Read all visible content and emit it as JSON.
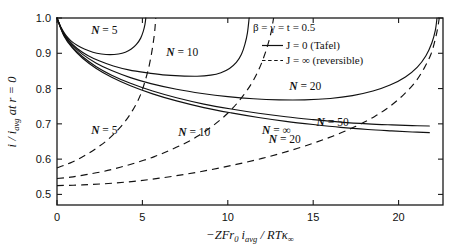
{
  "chart_data": {
    "type": "line",
    "title": "",
    "subtitle": "",
    "xlabel": "-ZFr0 iavg / RT K∞",
    "ylabel": "i / iavg at r = 0",
    "xlim": [
      0,
      22.6
    ],
    "ylim": [
      0.47,
      1.0
    ],
    "grid": false,
    "legend_position": "top-right",
    "xticks": [
      0,
      5,
      10,
      15,
      20
    ],
    "xtick_labels": [
      "0",
      "5",
      "10",
      "15",
      "20"
    ],
    "yticks": [
      0.5,
      0.6,
      0.7,
      0.8,
      0.9,
      1.0
    ],
    "ytick_labels": [
      "0.5",
      "0.6",
      "0.7",
      "0.8",
      "0.9",
      "1.0"
    ],
    "annotations": {
      "params": "β = γ = t = 0.5",
      "legend_solid": "J = 0  (Tafel)",
      "legend_dashed": "J = ∞  (reversible)"
    },
    "series": [
      {
        "name": "N = 5 (Tafel)",
        "label": "N = 5",
        "style": "solid",
        "label_x": 2.0,
        "label_y": 0.955,
        "points": [
          [
            0,
            1.0
          ],
          [
            0.25,
            0.972
          ],
          [
            0.5,
            0.952
          ],
          [
            0.8,
            0.936
          ],
          [
            1.2,
            0.922
          ],
          [
            1.6,
            0.912
          ],
          [
            2.1,
            0.903
          ],
          [
            2.6,
            0.898
          ],
          [
            3.1,
            0.896
          ],
          [
            3.6,
            0.898
          ],
          [
            4.0,
            0.903
          ],
          [
            4.35,
            0.912
          ],
          [
            4.65,
            0.925
          ],
          [
            4.9,
            0.943
          ],
          [
            5.05,
            0.962
          ],
          [
            5.15,
            0.982
          ],
          [
            5.2,
            1.0
          ]
        ]
      },
      {
        "name": "N = 10 (Tafel)",
        "label": "N = 10",
        "style": "solid",
        "label_x": 6.4,
        "label_y": 0.893,
        "points": [
          [
            0,
            1.0
          ],
          [
            0.3,
            0.963
          ],
          [
            0.7,
            0.936
          ],
          [
            1.2,
            0.913
          ],
          [
            1.8,
            0.894
          ],
          [
            2.5,
            0.878
          ],
          [
            3.3,
            0.864
          ],
          [
            4.2,
            0.853
          ],
          [
            5.2,
            0.845
          ],
          [
            6.2,
            0.839
          ],
          [
            7.2,
            0.836
          ],
          [
            8.2,
            0.835
          ],
          [
            9.0,
            0.838
          ],
          [
            9.6,
            0.845
          ],
          [
            10.1,
            0.857
          ],
          [
            10.5,
            0.874
          ],
          [
            10.8,
            0.897
          ],
          [
            11.0,
            0.925
          ],
          [
            11.15,
            0.958
          ],
          [
            11.25,
            1.0
          ]
        ]
      },
      {
        "name": "N = 20 (Tafel)",
        "label": "N = 20",
        "style": "solid",
        "label_x": 13.6,
        "label_y": 0.797,
        "points": [
          [
            0,
            1.0
          ],
          [
            0.4,
            0.955
          ],
          [
            0.9,
            0.923
          ],
          [
            1.5,
            0.897
          ],
          [
            2.3,
            0.872
          ],
          [
            3.2,
            0.851
          ],
          [
            4.3,
            0.831
          ],
          [
            5.5,
            0.814
          ],
          [
            7.0,
            0.798
          ],
          [
            8.5,
            0.786
          ],
          [
            10.0,
            0.777
          ],
          [
            11.5,
            0.771
          ],
          [
            13.0,
            0.768
          ],
          [
            14.5,
            0.768
          ],
          [
            16.0,
            0.772
          ],
          [
            17.3,
            0.78
          ],
          [
            18.5,
            0.793
          ],
          [
            19.5,
            0.81
          ],
          [
            20.4,
            0.833
          ],
          [
            21.1,
            0.861
          ],
          [
            21.6,
            0.893
          ],
          [
            21.95,
            0.93
          ],
          [
            22.15,
            0.965
          ],
          [
            22.25,
            1.0
          ]
        ]
      },
      {
        "name": "N = 50 (Tafel)",
        "label": "N = 50",
        "style": "solid",
        "label_x": 15.2,
        "label_y": 0.695,
        "points": [
          [
            0,
            1.0
          ],
          [
            0.4,
            0.952
          ],
          [
            0.9,
            0.918
          ],
          [
            1.5,
            0.89
          ],
          [
            2.3,
            0.862
          ],
          [
            3.2,
            0.838
          ],
          [
            4.3,
            0.815
          ],
          [
            5.6,
            0.793
          ],
          [
            7.0,
            0.774
          ],
          [
            8.6,
            0.756
          ],
          [
            10.2,
            0.742
          ],
          [
            11.8,
            0.73
          ],
          [
            13.4,
            0.72
          ],
          [
            15.0,
            0.712
          ],
          [
            16.6,
            0.705
          ],
          [
            18.2,
            0.7
          ],
          [
            19.6,
            0.697
          ],
          [
            20.8,
            0.695
          ],
          [
            21.8,
            0.694
          ]
        ]
      },
      {
        "name": "N = ∞ (Tafel)",
        "label": "N = ∞",
        "style": "solid",
        "label_x": 12.0,
        "label_y": 0.672,
        "points": [
          [
            0,
            1.0
          ],
          [
            0.4,
            0.95
          ],
          [
            0.9,
            0.915
          ],
          [
            1.5,
            0.886
          ],
          [
            2.3,
            0.857
          ],
          [
            3.2,
            0.832
          ],
          [
            4.3,
            0.808
          ],
          [
            5.6,
            0.785
          ],
          [
            7.0,
            0.765
          ],
          [
            8.6,
            0.746
          ],
          [
            10.2,
            0.731
          ],
          [
            11.8,
            0.718
          ],
          [
            13.4,
            0.707
          ],
          [
            15.0,
            0.698
          ],
          [
            16.6,
            0.69
          ],
          [
            18.2,
            0.684
          ],
          [
            19.6,
            0.68
          ],
          [
            20.8,
            0.677
          ],
          [
            21.8,
            0.675
          ]
        ]
      },
      {
        "name": "N = 5 (reversible)",
        "label": "N = 5",
        "style": "dashed",
        "label_x": 2.0,
        "label_y": 0.672,
        "points": [
          [
            0,
            0.575
          ],
          [
            0.4,
            0.582
          ],
          [
            0.9,
            0.592
          ],
          [
            1.4,
            0.604
          ],
          [
            1.9,
            0.618
          ],
          [
            2.4,
            0.634
          ],
          [
            2.9,
            0.652
          ],
          [
            3.3,
            0.67
          ],
          [
            3.7,
            0.69
          ],
          [
            4.1,
            0.714
          ],
          [
            4.4,
            0.736
          ],
          [
            4.7,
            0.762
          ],
          [
            4.95,
            0.79
          ],
          [
            5.15,
            0.82
          ],
          [
            5.35,
            0.855
          ],
          [
            5.5,
            0.89
          ],
          [
            5.62,
            0.925
          ],
          [
            5.72,
            0.962
          ],
          [
            5.78,
            1.0
          ]
        ]
      },
      {
        "name": "N = 10 (reversible)",
        "label": "N = 10",
        "style": "dashed",
        "label_x": 7.1,
        "label_y": 0.665,
        "points": [
          [
            0,
            0.545
          ],
          [
            0.8,
            0.549
          ],
          [
            1.7,
            0.556
          ],
          [
            2.7,
            0.565
          ],
          [
            3.7,
            0.577
          ],
          [
            4.7,
            0.591
          ],
          [
            5.7,
            0.607
          ],
          [
            6.6,
            0.625
          ],
          [
            7.5,
            0.645
          ],
          [
            8.3,
            0.667
          ],
          [
            9.0,
            0.69
          ],
          [
            9.7,
            0.717
          ],
          [
            10.3,
            0.745
          ],
          [
            10.9,
            0.78
          ],
          [
            11.4,
            0.815
          ],
          [
            11.8,
            0.852
          ],
          [
            12.1,
            0.888
          ],
          [
            12.35,
            0.925
          ],
          [
            12.55,
            0.963
          ],
          [
            12.68,
            1.0
          ]
        ]
      },
      {
        "name": "N = 20 (reversible)",
        "label": "N = 20",
        "style": "dashed",
        "label_x": 12.4,
        "label_y": 0.645,
        "points": [
          [
            0,
            0.525
          ],
          [
            1.5,
            0.527
          ],
          [
            3.0,
            0.531
          ],
          [
            4.5,
            0.537
          ],
          [
            6.0,
            0.546
          ],
          [
            7.5,
            0.557
          ],
          [
            9.0,
            0.57
          ],
          [
            10.5,
            0.585
          ],
          [
            12.0,
            0.602
          ],
          [
            13.5,
            0.622
          ],
          [
            15.0,
            0.645
          ],
          [
            16.3,
            0.668
          ],
          [
            17.5,
            0.693
          ],
          [
            18.6,
            0.721
          ],
          [
            19.5,
            0.75
          ],
          [
            20.3,
            0.783
          ],
          [
            21.0,
            0.82
          ],
          [
            21.5,
            0.858
          ],
          [
            21.9,
            0.898
          ],
          [
            22.15,
            0.94
          ],
          [
            22.3,
            0.975
          ],
          [
            22.38,
            1.0
          ]
        ]
      }
    ]
  },
  "axis": {
    "ylabel_parts": {
      "i": "i",
      "slash": "/",
      "iavg": "i",
      "avg": "avg",
      "at": " at ",
      "r": "r",
      "eq0": " = 0"
    },
    "xlabel_parts": {
      "minusZFr": "−ZFr",
      "zero": "0",
      "i": "i",
      "avg": "avg",
      "slash": " / ",
      "RT": "RT",
      "kappa": "κ",
      "inf": "∞"
    }
  }
}
